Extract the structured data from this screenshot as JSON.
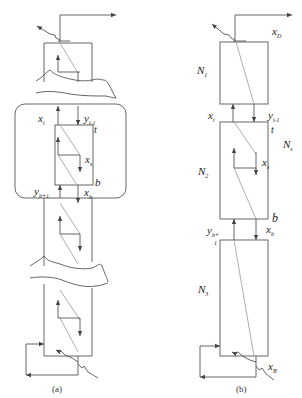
{
  "diagram": {
    "panel_a": {
      "caption": "(a)",
      "labels": {
        "x_t": "x",
        "x_t_sub": "t",
        "y_t1": "y",
        "y_t1_sub": "t-1",
        "t": "t",
        "x_s": "x",
        "x_s_sub": "s",
        "b": "b",
        "y_b1": "y",
        "y_b1_sub": "b+1",
        "x_b": "x",
        "x_b_sub": "b"
      }
    },
    "panel_b": {
      "caption": "(b)",
      "labels": {
        "x_D": "x",
        "x_D_sub": "D",
        "N1": "N",
        "N1_sub": "1",
        "x_t": "x",
        "x_t_sub": "t",
        "y_t1": "y",
        "y_t1_sub": "t-1",
        "t": "t",
        "Ns": "N",
        "Ns_sub": "s",
        "N2": "N",
        "N2_sub": "2",
        "x_s": "x",
        "x_s_sub": "s",
        "b": "b",
        "y_b1": "y",
        "y_b1_sub": "b+",
        "y_b1_sub2": "1",
        "x_b": "x",
        "x_b_sub": "b",
        "N3": "N",
        "N3_sub": "3",
        "x_B": "x",
        "x_B_sub": "B"
      }
    }
  }
}
